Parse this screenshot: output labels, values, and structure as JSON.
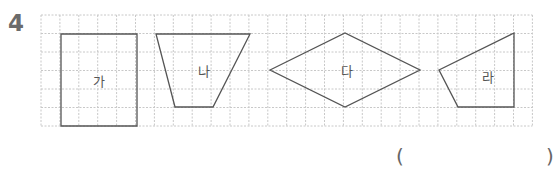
{
  "question": {
    "number": "4"
  },
  "grid": {
    "left": 41,
    "top": 15,
    "cols": 26,
    "rows": 6,
    "cell_w": 18.9,
    "cell_h": 18.5,
    "line_color": "#c8c8c8",
    "stroke_color": "#555555"
  },
  "shapes": [
    {
      "label": "가",
      "kind": "rectangle",
      "points": "61,34 137,34 137,126 61,126",
      "label_pos": [
        99,
        86
      ]
    },
    {
      "label": "나",
      "kind": "trapezoid",
      "points": "156,34 250,34 213,107 175,107",
      "label_pos": [
        204,
        76
      ]
    },
    {
      "label": "다",
      "kind": "rhombus",
      "points": "270,70 345,33 420,70 345,107",
      "label_pos": [
        347,
        76
      ]
    },
    {
      "label": "라",
      "kind": "quadrilateral",
      "points": "514,33 439,70 458,107 514,107",
      "label_pos": [
        488,
        82
      ]
    }
  ],
  "answer": {
    "open_paren": "(",
    "close_paren": ")",
    "value": ""
  }
}
